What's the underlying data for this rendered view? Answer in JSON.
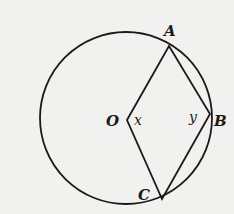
{
  "diagram": {
    "type": "geometry-circle",
    "circle": {
      "cx": 126,
      "cy": 118,
      "r": 86
    },
    "points": {
      "O": {
        "label": "O",
        "x": 127,
        "y": 120
      },
      "A": {
        "label": "A",
        "x": 169,
        "y": 46
      },
      "B": {
        "label": "B",
        "x": 210,
        "y": 114
      },
      "C": {
        "label": "C",
        "x": 162,
        "y": 199
      }
    },
    "segments": [
      "OA",
      "AB",
      "BC",
      "CO"
    ],
    "angles": {
      "x": {
        "label": "x",
        "at": "O"
      },
      "y": {
        "label": "y",
        "at": "B"
      }
    },
    "colors": {
      "stroke": "#1a1a1a",
      "background": "#f1f1ef"
    }
  }
}
